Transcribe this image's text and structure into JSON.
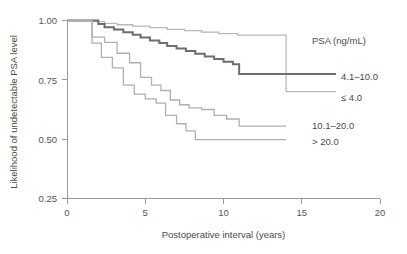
{
  "chart_data": {
    "type": "line",
    "subtype": "kaplan-meier-step",
    "title": "",
    "xlabel": "Postoperative interval (years)",
    "ylabel": "Likelihood of undetectable PSA level",
    "xlim": [
      0,
      20
    ],
    "ylim": [
      0.25,
      1.0
    ],
    "xticks": [
      0,
      5,
      10,
      15,
      20
    ],
    "xtick_labels": [
      "0",
      "5",
      "10",
      "15",
      "20"
    ],
    "yticks": [
      0.25,
      0.5,
      0.75,
      1.0
    ],
    "ytick_labels": [
      "0.25",
      "0.50",
      "0.75",
      "1.00"
    ],
    "grid": false,
    "legend_position": "right",
    "legend_title": "PSA (ng/mL)",
    "series": [
      {
        "name": "≤ 4.0",
        "label": "≤ 4.0",
        "color": "#b8b8b8",
        "width": 1.3,
        "x": [
          0,
          1.0,
          1.6,
          2.4,
          3.2,
          4.2,
          5.3,
          6.4,
          7.5,
          8.6,
          9.7,
          10.9,
          14.0,
          14.0
        ],
        "y": [
          1.0,
          1.0,
          0.995,
          0.988,
          0.982,
          0.976,
          0.97,
          0.963,
          0.957,
          0.951,
          0.945,
          0.938,
          0.938,
          0.7
        ]
      },
      {
        "name": "4.1–10.0",
        "label": "4.1–10.0",
        "color": "#6e6e6e",
        "width": 2.0,
        "x": [
          0,
          1.0,
          2.0,
          2.4,
          3.0,
          3.6,
          4.2,
          4.7,
          5.3,
          5.9,
          6.4,
          7.0,
          7.6,
          8.2,
          8.8,
          9.4,
          10.0,
          10.6,
          11.0,
          14.0
        ],
        "y": [
          1.0,
          1.0,
          0.985,
          0.972,
          0.962,
          0.95,
          0.94,
          0.928,
          0.916,
          0.905,
          0.893,
          0.882,
          0.872,
          0.86,
          0.848,
          0.838,
          0.826,
          0.816,
          0.775,
          0.775
        ]
      },
      {
        "name": "10.1–20.0",
        "label": "10.1–20.0",
        "color": "#b0b0b0",
        "width": 1.3,
        "x": [
          0,
          1.0,
          1.6,
          2.4,
          3.2,
          4.0,
          4.7,
          5.4,
          6.0,
          6.6,
          7.2,
          7.8,
          8.6,
          9.4,
          10.2,
          11.0,
          14.0
        ],
        "y": [
          1.0,
          1.0,
          0.93,
          0.908,
          0.862,
          0.822,
          0.76,
          0.728,
          0.705,
          0.665,
          0.645,
          0.632,
          0.625,
          0.6,
          0.585,
          0.555,
          0.555
        ]
      },
      {
        "name": "> 20.0",
        "label": "> 20.0",
        "color": "#b0b0b0",
        "width": 1.3,
        "x": [
          0,
          1.0,
          1.6,
          2.2,
          2.9,
          3.6,
          4.3,
          5.0,
          5.7,
          6.3,
          7.0,
          7.6,
          8.2,
          14.0
        ],
        "y": [
          1.0,
          1.0,
          0.905,
          0.845,
          0.8,
          0.728,
          0.69,
          0.67,
          0.652,
          0.6,
          0.565,
          0.535,
          0.498,
          0.498
        ]
      }
    ]
  },
  "legend": {
    "title": "PSA (ng/mL)",
    "entries": [
      {
        "label": "4.1–10.0"
      },
      {
        "label": "≤ 4.0"
      },
      {
        "label": "10.1–20.0"
      },
      {
        "label": "> 20.0"
      }
    ]
  },
  "axes": {
    "x_title": "Postoperative interval (years)",
    "y_title": "Likelihood of undetectable PSA level",
    "x_tick_labels": [
      "0",
      "5",
      "10",
      "15",
      "20"
    ],
    "y_tick_labels": [
      "1.00",
      "0.75",
      "0.50",
      "0.25"
    ]
  }
}
